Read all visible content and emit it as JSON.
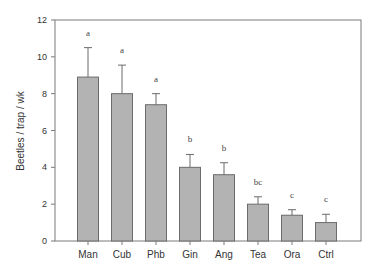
{
  "chart_data": {
    "type": "bar",
    "title": "",
    "xlabel": "",
    "ylabel": "Beetles / trap / wk",
    "ylim": [
      0,
      12
    ],
    "yticks": [
      0,
      2,
      4,
      6,
      8,
      10,
      12
    ],
    "grid": false,
    "legend": null,
    "categories": [
      "Man",
      "Cub",
      "Phb",
      "Gin",
      "Ang",
      "Tea",
      "Ora",
      "Ctrl"
    ],
    "values": [
      8.9,
      8.0,
      7.4,
      4.0,
      3.6,
      2.0,
      1.4,
      1.0
    ],
    "error_upper": [
      10.5,
      9.55,
      8.0,
      4.7,
      4.25,
      2.4,
      1.7,
      1.45
    ],
    "significance_letters": [
      "a",
      "a",
      "a",
      "b",
      "b",
      "bc",
      "c",
      "c"
    ]
  },
  "colors": {
    "bar_fill": "#b3b3b3",
    "bar_stroke": "#6b6b6b",
    "axis": "#7a7a7a",
    "text": "#333333"
  }
}
